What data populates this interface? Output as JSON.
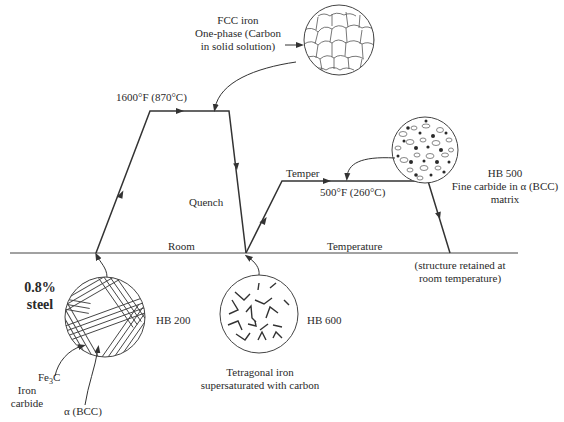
{
  "diagram": {
    "material_label": [
      "0.8%",
      "steel"
    ],
    "axis": {
      "left_label": "Room",
      "right_label": "Temperature"
    },
    "stages": {
      "austenitize_temp": "1600°F (870°C)",
      "quench_label": "Quench",
      "temper_label": "Temper",
      "temper_temp": "500°F (260°C)"
    },
    "structures": {
      "fcc": {
        "lines": [
          "FCC iron",
          "One-phase (Carbon",
          "in solid solution)"
        ]
      },
      "pearlite": {
        "hardness": "HB 200",
        "fe3c_label": "Fe",
        "fe3c_sub": "3",
        "fe3c_suffix": "C",
        "iron_carbide": [
          "Iron",
          "carbide"
        ],
        "alpha_label": "α (BCC)"
      },
      "martensite": {
        "hardness": "HB 600",
        "lines": [
          "Tetragonal iron",
          "supersaturated with carbon"
        ]
      },
      "tempered": {
        "hardness": "HB 500",
        "lines": [
          "Fine carbide in α (BCC)",
          "matrix"
        ]
      },
      "retained_note": [
        "(structure retained at",
        "room temperature)"
      ]
    },
    "colors": {
      "line": "#333333",
      "dark_particle": "#2a2a2a"
    }
  }
}
